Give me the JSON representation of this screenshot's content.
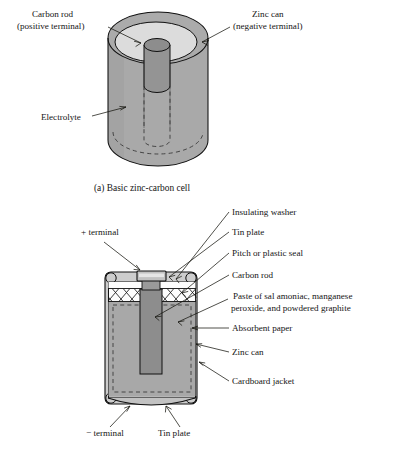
{
  "figure": {
    "caption_a": "(a) Basic zinc-carbon cell",
    "colors": {
      "cylinder_body": "#a9a9a9",
      "electrolyte_top": "#d9d9d9",
      "carbon_rod": "#8f8f8f",
      "paste": "#a6a6a6",
      "zinc_can": "#b4b4b4",
      "jacket": "#c9c9c9",
      "tin_plate": "#bdbdbd",
      "seal_white": "#fdfdfd",
      "ink": "#141414"
    }
  },
  "diagram_a": {
    "labels": [
      {
        "id": "carbon-rod",
        "line1": "Carbon rod",
        "line2": "(positive terminal)"
      },
      {
        "id": "zinc-can",
        "line1": "Zinc can",
        "line2": "(negative terminal)"
      },
      {
        "id": "electrolyte",
        "line1": "Electrolyte",
        "line2": ""
      }
    ]
  },
  "diagram_b": {
    "labels_right": [
      {
        "id": "insulating-washer",
        "text": "Insulating washer"
      },
      {
        "id": "tin-plate-top",
        "text": "Tin plate"
      },
      {
        "id": "pitch-seal",
        "text": "Pitch or plastic seal"
      },
      {
        "id": "carbon-rod",
        "text": "Carbon rod"
      },
      {
        "id": "paste-line1",
        "text": "Paste of sal amoniac, manganese"
      },
      {
        "id": "paste-line2",
        "text": "peroxide, and powdered graphite"
      },
      {
        "id": "absorbent-paper",
        "text": "Absorbent paper"
      },
      {
        "id": "zinc-can",
        "text": "Zinc can"
      },
      {
        "id": "cardboard-jacket",
        "text": "Cardboard jacket"
      }
    ],
    "labels_left": [
      {
        "id": "positive-terminal",
        "text": "+ terminal"
      }
    ],
    "labels_bottom": [
      {
        "id": "negative-terminal",
        "text": "− terminal"
      },
      {
        "id": "tin-plate-bottom",
        "text": "Tin plate"
      }
    ]
  }
}
